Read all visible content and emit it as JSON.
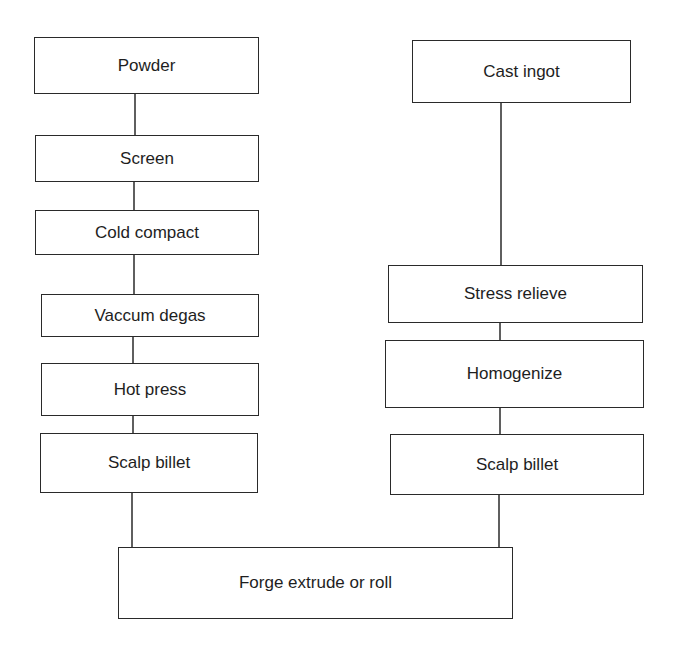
{
  "diagram": {
    "type": "process-flowchart",
    "line_color": "#2a2a2a",
    "text_color": "#1e1e1e",
    "nodes": [
      {
        "id": "powder",
        "label": "Powder",
        "column": "left",
        "x": 34,
        "y": 37,
        "w": 225,
        "h": 57
      },
      {
        "id": "screen",
        "label": "Screen",
        "column": "left",
        "x": 35,
        "y": 135,
        "w": 224,
        "h": 47
      },
      {
        "id": "cold-compact",
        "label": "Cold compact",
        "column": "left",
        "x": 35,
        "y": 210,
        "w": 224,
        "h": 45
      },
      {
        "id": "vaccum-degas",
        "label": "Vaccum degas",
        "column": "left",
        "x": 41,
        "y": 294,
        "w": 218,
        "h": 43
      },
      {
        "id": "hot-press",
        "label": "Hot press",
        "column": "left",
        "x": 41,
        "y": 363,
        "w": 218,
        "h": 53
      },
      {
        "id": "scalp-billet-left",
        "label": "Scalp billet",
        "column": "left",
        "x": 40,
        "y": 433,
        "w": 218,
        "h": 60
      },
      {
        "id": "cast-ingot",
        "label": "Cast ingot",
        "column": "right",
        "x": 412,
        "y": 40,
        "w": 219,
        "h": 63
      },
      {
        "id": "stress-relieve",
        "label": "Stress relieve",
        "column": "right",
        "x": 388,
        "y": 265,
        "w": 255,
        "h": 58
      },
      {
        "id": "homogenize",
        "label": "Homogenize",
        "column": "right",
        "x": 385,
        "y": 340,
        "w": 259,
        "h": 68
      },
      {
        "id": "scalp-billet-right",
        "label": "Scalp billet",
        "column": "right",
        "x": 390,
        "y": 434,
        "w": 254,
        "h": 61
      },
      {
        "id": "forge-extrude-roll",
        "label": "Forge extrude or roll",
        "column": "bottom",
        "x": 118,
        "y": 547,
        "w": 395,
        "h": 72
      }
    ],
    "edges": [
      {
        "from": "powder",
        "to": "screen",
        "x1": 135,
        "y1": 94,
        "x2": 135,
        "y2": 135
      },
      {
        "from": "screen",
        "to": "cold-compact",
        "x1": 134,
        "y1": 182,
        "x2": 134,
        "y2": 210
      },
      {
        "from": "cold-compact",
        "to": "vaccum-degas",
        "x1": 134,
        "y1": 255,
        "x2": 134,
        "y2": 294
      },
      {
        "from": "vaccum-degas",
        "to": "hot-press",
        "x1": 133,
        "y1": 337,
        "x2": 133,
        "y2": 363
      },
      {
        "from": "hot-press",
        "to": "scalp-billet-left",
        "x1": 133,
        "y1": 416,
        "x2": 133,
        "y2": 433
      },
      {
        "from": "scalp-billet-left",
        "to": "forge-extrude-roll",
        "x1": 132,
        "y1": 493,
        "x2": 132,
        "y2": 547
      },
      {
        "from": "cast-ingot",
        "to": "stress-relieve",
        "x1": 501,
        "y1": 103,
        "x2": 501,
        "y2": 265
      },
      {
        "from": "stress-relieve",
        "to": "homogenize",
        "x1": 500,
        "y1": 323,
        "x2": 500,
        "y2": 340
      },
      {
        "from": "homogenize",
        "to": "scalp-billet-right",
        "x1": 500,
        "y1": 408,
        "x2": 500,
        "y2": 434
      },
      {
        "from": "scalp-billet-right",
        "to": "forge-extrude-roll",
        "x1": 499,
        "y1": 495,
        "x2": 499,
        "y2": 547
      }
    ]
  }
}
